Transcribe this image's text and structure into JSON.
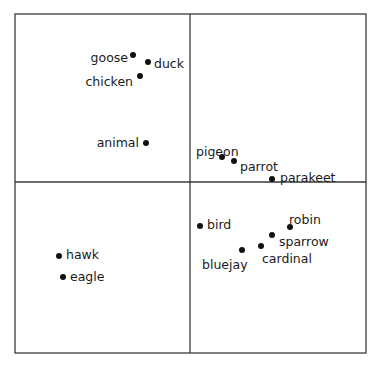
{
  "chart_data": {
    "type": "scatter",
    "title": "",
    "xlabel": "",
    "ylabel": "",
    "grid": false,
    "legend": null,
    "quadrant_dividers": true,
    "frame": {
      "left": 15,
      "top": 14,
      "right": 366,
      "bottom": 353
    },
    "divider": {
      "x": 190,
      "y": 182
    },
    "points": [
      {
        "label": "goose",
        "x": 133,
        "y": 55,
        "lx": 128,
        "ly": 58,
        "anchor": "end"
      },
      {
        "label": "duck",
        "x": 148,
        "y": 62,
        "lx": 154,
        "ly": 64,
        "anchor": "start"
      },
      {
        "label": "chicken",
        "x": 140,
        "y": 76,
        "lx": 133,
        "ly": 82,
        "anchor": "end"
      },
      {
        "label": "animal",
        "x": 146,
        "y": 143,
        "lx": 139,
        "ly": 143,
        "anchor": "end"
      },
      {
        "label": "pigeon",
        "x": 222,
        "y": 157,
        "lx": 196,
        "ly": 152,
        "anchor": "start"
      },
      {
        "label": "parrot",
        "x": 234,
        "y": 161,
        "lx": 240,
        "ly": 167,
        "anchor": "start"
      },
      {
        "label": "parakeet",
        "x": 272,
        "y": 179,
        "lx": 280,
        "ly": 178,
        "anchor": "start"
      },
      {
        "label": "hawk",
        "x": 59,
        "y": 256,
        "lx": 66,
        "ly": 255,
        "anchor": "start"
      },
      {
        "label": "eagle",
        "x": 63,
        "y": 277,
        "lx": 70,
        "ly": 277,
        "anchor": "start"
      },
      {
        "label": "bird",
        "x": 200,
        "y": 226,
        "lx": 207,
        "ly": 225,
        "anchor": "start"
      },
      {
        "label": "robin",
        "x": 290,
        "y": 227,
        "lx": 289,
        "ly": 220,
        "anchor": "start"
      },
      {
        "label": "sparrow",
        "x": 272,
        "y": 235,
        "lx": 279,
        "ly": 242,
        "anchor": "start"
      },
      {
        "label": "cardinal",
        "x": 261,
        "y": 246,
        "lx": 262,
        "ly": 259,
        "anchor": "start"
      },
      {
        "label": "bluejay",
        "x": 242,
        "y": 250,
        "lx": 202,
        "ly": 265,
        "anchor": "start"
      }
    ]
  },
  "colors": {
    "frame": "#3a3a3a",
    "dot": "#111111",
    "text": "#1a1a1a",
    "background": "#ffffff"
  }
}
